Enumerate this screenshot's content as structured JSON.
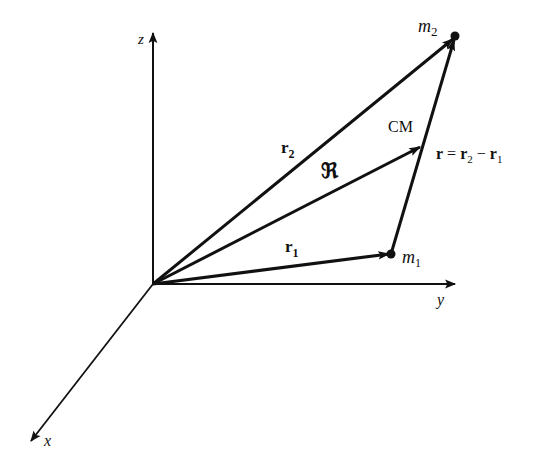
{
  "diagram": {
    "axes": {
      "z": {
        "label": "z"
      },
      "y": {
        "label": "y"
      },
      "x": {
        "label": "x"
      }
    },
    "points": {
      "m1": {
        "label": "m",
        "sub": "1"
      },
      "m2": {
        "label": "m",
        "sub": "2"
      },
      "cm": {
        "label": "CM"
      }
    },
    "vectors": {
      "r1": {
        "label": "r",
        "sub": "1",
        "from": "origin",
        "to": "m1"
      },
      "r2": {
        "label": "r",
        "sub": "2",
        "from": "origin",
        "to": "m2"
      },
      "R": {
        "label": "ℜ",
        "from": "origin",
        "to": "CM"
      },
      "r": {
        "label": "r",
        "from": "m1",
        "to": "m2",
        "eq_lhs": "r",
        "eq_op": " = ",
        "eq_a": "r",
        "eq_a_sub": "2",
        "eq_minus": " − ",
        "eq_b": "r",
        "eq_b_sub": "1"
      }
    },
    "colors": {
      "ink": "#111111",
      "background": "#ffffff"
    }
  }
}
